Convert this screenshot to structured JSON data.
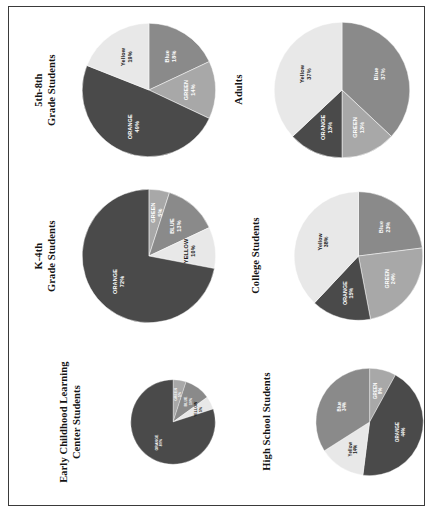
{
  "figure": {
    "orientation": "rotated-90",
    "columns": 2,
    "rows": 3
  },
  "palette": {
    "ORANGE": "#4a4a4a",
    "BLUE": "#8a8a8a",
    "GREEN": "#a8a8a8",
    "YELLOW": "#e8e8e8",
    "outline": "#3a3a3a",
    "label_light": "#ffffff",
    "label_dark": "#1a1a1a",
    "background": "#ffffff"
  },
  "chart_data": [
    {
      "id": "grade-5-8",
      "type": "pie",
      "title": "5th-8th\nGrade Students",
      "title_lines": [
        "5th-8th",
        "Grade Students"
      ],
      "labels": [
        "Blue",
        "GREEN",
        "ORANGE",
        "Yellow"
      ],
      "values": [
        18,
        14,
        49,
        19
      ],
      "value_labels": [
        "18%",
        "14%",
        "49%",
        "19%"
      ],
      "colors": [
        "#8a8a8a",
        "#a8a8a8",
        "#4a4a4a",
        "#e8e8e8"
      ],
      "label_colors": [
        "light",
        "light",
        "light",
        "dark"
      ],
      "start_angle": 0
    },
    {
      "id": "k-4",
      "type": "pie",
      "title": "K-4th\nGrade Students",
      "title_lines": [
        "K-4th",
        "Grade Students"
      ],
      "labels": [
        "GREEN",
        "BLUE",
        "YELLOW",
        "ORANGE"
      ],
      "values": [
        5,
        13,
        10,
        72
      ],
      "value_labels": [
        "5%",
        "13%",
        "10%",
        "72%"
      ],
      "colors": [
        "#a8a8a8",
        "#8a8a8a",
        "#e8e8e8",
        "#4a4a4a"
      ],
      "label_colors": [
        "light",
        "light",
        "dark",
        "light"
      ],
      "start_angle": 0
    },
    {
      "id": "early-childhood",
      "type": "pie",
      "title": "Early Childhood Learning\nCenter Students",
      "title_lines": [
        "Early Childhood Learning",
        "Center Students"
      ],
      "labels": [
        "GREEN",
        "BLUE",
        "YELLOW",
        "ORANGE"
      ],
      "values": [
        5,
        10,
        5,
        80
      ],
      "value_labels": [
        "5%",
        "10%",
        "5%",
        "80%"
      ],
      "colors": [
        "#a8a8a8",
        "#8a8a8a",
        "#e8e8e8",
        "#4a4a4a"
      ],
      "label_colors": [
        "light",
        "light",
        "dark",
        "light"
      ],
      "start_angle": 0
    },
    {
      "id": "adults",
      "type": "pie",
      "title": "Adults",
      "title_lines": [
        "Adults"
      ],
      "labels": [
        "Blue",
        "GREEN",
        "ORANGE",
        "Yellow"
      ],
      "values": [
        37,
        13,
        13,
        37
      ],
      "value_labels": [
        "37%",
        "13%",
        "13%",
        "37%"
      ],
      "colors": [
        "#8a8a8a",
        "#a8a8a8",
        "#4a4a4a",
        "#e8e8e8"
      ],
      "label_colors": [
        "light",
        "light",
        "light",
        "dark"
      ],
      "start_angle": 0
    },
    {
      "id": "college",
      "type": "pie",
      "title": "College Students",
      "title_lines": [
        "College Students"
      ],
      "labels": [
        "Blue",
        "GREEN",
        "ORANGE",
        "Yellow"
      ],
      "values": [
        23,
        24,
        15,
        38
      ],
      "value_labels": [
        "23%",
        "24%",
        "15%",
        "38%"
      ],
      "colors": [
        "#8a8a8a",
        "#a8a8a8",
        "#4a4a4a",
        "#e8e8e8"
      ],
      "label_colors": [
        "light",
        "light",
        "light",
        "dark"
      ],
      "start_angle": 0
    },
    {
      "id": "high-school",
      "type": "pie",
      "title": "High School Students",
      "title_lines": [
        "High School Students"
      ],
      "labels": [
        "GREEN",
        "ORANGE",
        "Yellow",
        "Blue"
      ],
      "values": [
        8,
        44,
        14,
        34
      ],
      "value_labels": [
        "8%",
        "44%",
        "14%",
        "34%"
      ],
      "colors": [
        "#a8a8a8",
        "#4a4a4a",
        "#e8e8e8",
        "#8a8a8a"
      ],
      "label_colors": [
        "light",
        "light",
        "dark",
        "light"
      ],
      "start_angle": 0
    }
  ],
  "columns": {
    "left": [
      "grade-5-8",
      "k-4",
      "early-childhood"
    ],
    "right": [
      "adults",
      "college",
      "high-school"
    ]
  }
}
